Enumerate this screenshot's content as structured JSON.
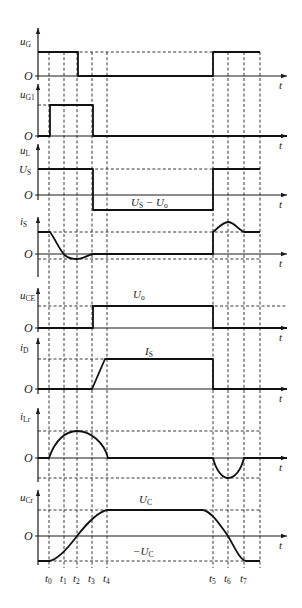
{
  "figure": {
    "caption": "",
    "axis_x_label": "t",
    "origin_label": "O",
    "time_markers": [
      {
        "name": "t0",
        "base": "t",
        "sub": "0",
        "x": 49
      },
      {
        "name": "t1",
        "base": "t",
        "sub": "1",
        "x": 64
      },
      {
        "name": "t2",
        "base": "t",
        "sub": "2",
        "x": 77
      },
      {
        "name": "t3",
        "base": "t",
        "sub": "3",
        "x": 92
      },
      {
        "name": "t4",
        "base": "t",
        "sub": "4",
        "x": 107
      },
      {
        "name": "t5",
        "base": "t",
        "sub": "5",
        "x": 213
      },
      {
        "name": "t6",
        "base": "t",
        "sub": "6",
        "x": 228
      },
      {
        "name": "t7",
        "base": "t",
        "sub": "7",
        "x": 244
      }
    ],
    "end_marker_x": 260,
    "y_axis_x": 38,
    "x_axis_end": 287
  },
  "panels": [
    {
      "id": "uG",
      "ylabel": "u",
      "ysub": "G",
      "label_y": 45,
      "axis_top": 28,
      "zero_y": 76,
      "axis_bottom": 80,
      "levels": [
        {
          "y": 52,
          "label": "",
          "x1": 38,
          "x2": 260
        }
      ],
      "wave": "M38,52 L78,52 L78,76 L213,76 L213,52 L260,52",
      "annotations": []
    },
    {
      "id": "uG1",
      "ylabel": "u",
      "ysub": "G1",
      "label_y": 98,
      "axis_top": 84,
      "zero_y": 136,
      "axis_bottom": 138,
      "levels": [
        {
          "y": 105,
          "label": "",
          "x1": 38,
          "x2": 50
        }
      ],
      "wave": "M38,136 L50,136 L50,105 L93,105 L93,136 L287,136",
      "annotations": []
    },
    {
      "id": "uL",
      "ylabel": "u",
      "ysub": "L",
      "label_y": 154,
      "axis_top": 144,
      "zero_y": 195,
      "axis_bottom": 200,
      "levels": [
        {
          "y": 169,
          "label": "US",
          "x1": 38,
          "x2": 260
        },
        {
          "y": 210,
          "label": "",
          "x1": 93,
          "x2": 213
        }
      ],
      "wave": "M38,169 L93,169 L93,210 L213,210 L213,169 L260,169",
      "annotations": [
        {
          "text": "U",
          "sub": "S",
          "tail": " − U",
          "tailsub": "o",
          "x": 131,
          "y": 206
        }
      ]
    },
    {
      "id": "iS",
      "ylabel": "i",
      "ysub": "S",
      "label_y": 225,
      "axis_top": 217,
      "zero_y": 254,
      "axis_bottom": 277,
      "levels": [
        {
          "y": 232,
          "label": "",
          "x1": 38,
          "x2": 260
        },
        {
          "y": 259,
          "label": "",
          "x1": 38,
          "x2": 260
        }
      ],
      "wave": "M38,232 L50,232 C56,240 60,252 66,256 C70,259 74,259 77,259 C82,259 88,255 93,254 L213,254 L213,232 C218,228 223,222 228,222 C234,222 239,230 244,232 L260,232",
      "annotations": []
    },
    {
      "id": "uCE",
      "ylabel": "u",
      "ysub": "CE",
      "label_y": 299,
      "axis_top": 288,
      "zero_y": 328,
      "axis_bottom": 332,
      "levels": [
        {
          "y": 306,
          "label": "",
          "x1": 38,
          "x2": 287
        }
      ],
      "wave": "M38,328 L93,328 L93,306 L213,306 L213,328 L287,328",
      "annotations": [
        {
          "text": "U",
          "sub": "o",
          "tail": "",
          "tailsub": "",
          "x": 133,
          "y": 298
        }
      ]
    },
    {
      "id": "iD",
      "ylabel": "i",
      "ysub": "D",
      "label_y": 351,
      "axis_top": 338,
      "zero_y": 389,
      "axis_bottom": 394,
      "levels": [
        {
          "y": 359,
          "label": "",
          "x1": 38,
          "x2": 213
        }
      ],
      "wave": "M38,389 L92,389 L105,359 L213,359 L213,389 L287,389",
      "annotations": [
        {
          "text": "I",
          "sub": "S",
          "tail": "",
          "tailsub": "",
          "x": 145,
          "y": 355
        }
      ]
    },
    {
      "id": "iLr",
      "ylabel": "i",
      "ysub": "Lr",
      "label_y": 420,
      "axis_top": 408,
      "zero_y": 458,
      "axis_bottom": 482,
      "levels": [
        {
          "y": 431,
          "label": "",
          "x1": 38,
          "x2": 260
        },
        {
          "y": 478,
          "label": "",
          "x1": 38,
          "x2": 260
        }
      ],
      "wave": "M38,458 L49,458 C55,440 66,431 77,431 C90,431 104,442 108,458 L213,458 C216,470 222,478 228,478 C235,478 241,470 244,458 L287,458",
      "annotations": []
    },
    {
      "id": "uCr",
      "ylabel": "u",
      "ysub": "Cr",
      "label_y": 501,
      "axis_top": 490,
      "zero_y": 536,
      "axis_bottom": 565,
      "levels": [
        {
          "y": 510,
          "label": "",
          "x1": 38,
          "x2": 260
        },
        {
          "y": 561,
          "label": "",
          "x1": 38,
          "x2": 260
        }
      ],
      "wave": "M38,561 L49,561 C58,560 68,548 77,536 C88,522 98,512 107,510 L203,510 C212,512 220,525 228,536 C235,548 240,560 246,561 L260,561",
      "annotations": [
        {
          "text": "U",
          "sub": "C",
          "tail": "",
          "tailsub": "",
          "x": 139,
          "y": 503
        },
        {
          "text": "−U",
          "sub": "C",
          "tail": "",
          "tailsub": "",
          "x": 133,
          "y": 555
        }
      ]
    }
  ],
  "level_labels": {
    "uL_high": {
      "text": "U",
      "sub": "S"
    }
  }
}
